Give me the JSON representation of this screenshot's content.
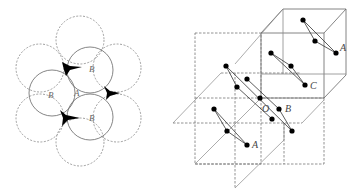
{
  "figure": {
    "left_panel": {
      "description": "Close-packed circles (top view) with void sites",
      "labels": {
        "b_top": "B",
        "b_left": "B",
        "b_bottom": "B",
        "center": "A"
      }
    },
    "right_panel": {
      "description": "Stacked unit cells with atom pairs",
      "labels": {
        "a_top": "A",
        "c": "C",
        "o": "O",
        "b": "B",
        "a_bottom": "A"
      }
    },
    "colors": {
      "line": "#555555",
      "dashed": "#777777",
      "atom": "#000000",
      "background": "#ffffff"
    }
  }
}
